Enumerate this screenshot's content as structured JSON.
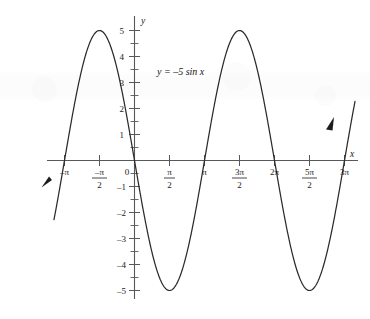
{
  "chart_data": {
    "type": "line",
    "title": "",
    "equation_label": "y = –5 sin x",
    "function": "y = -5*sin(x)",
    "xlabel": "x",
    "ylabel": "y",
    "grid": false,
    "legend": "none",
    "amplitude": 5,
    "period": "2π",
    "xlim": [
      -3.6128,
      9.896
    ],
    "ylim": [
      -5.6,
      5.6
    ],
    "x_tick_labels": [
      {
        "value": -3.14159,
        "label": "–π",
        "type": "plain"
      },
      {
        "value": -1.5708,
        "label": "–π/2",
        "type": "fraction",
        "numerator": "–π",
        "denominator": "2"
      },
      {
        "value": 0,
        "label": "0",
        "type": "plain"
      },
      {
        "value": 1.5708,
        "label": "π/2",
        "type": "fraction",
        "numerator": "π",
        "denominator": "2"
      },
      {
        "value": 3.14159,
        "label": "π",
        "type": "plain"
      },
      {
        "value": 4.71239,
        "label": "3π/2",
        "type": "fraction",
        "numerator": "3π",
        "denominator": "2"
      },
      {
        "value": 6.28319,
        "label": "2π",
        "type": "plain"
      },
      {
        "value": 7.85398,
        "label": "5π/2",
        "type": "fraction",
        "numerator": "5π",
        "denominator": "2"
      },
      {
        "value": 9.42478,
        "label": "3π",
        "type": "plain"
      }
    ],
    "y_tick_labels": [
      {
        "value": 5,
        "label": "5"
      },
      {
        "value": 4,
        "label": "4"
      },
      {
        "value": 3,
        "label": "3"
      },
      {
        "value": 2,
        "label": "2"
      },
      {
        "value": 1,
        "label": "1"
      },
      {
        "value": -1,
        "label": "–1"
      },
      {
        "value": -2,
        "label": "–2"
      },
      {
        "value": -3,
        "label": "–3"
      },
      {
        "value": -4,
        "label": "–4"
      },
      {
        "value": -5,
        "label": "–5"
      }
    ],
    "y_minor_ticks": [
      4.5,
      3.5,
      2.5,
      1.5,
      0.5,
      -0.5,
      -1.5,
      -2.5,
      -3.5,
      -4.5
    ],
    "key_points": [
      {
        "x": -3.14159,
        "y": 0,
        "note": "zero crossing"
      },
      {
        "x": -1.5708,
        "y": 5,
        "note": "maximum"
      },
      {
        "x": 0,
        "y": 0,
        "note": "zero crossing, decreasing"
      },
      {
        "x": 1.5708,
        "y": -5,
        "note": "minimum"
      },
      {
        "x": 3.14159,
        "y": 0,
        "note": "zero crossing"
      },
      {
        "x": 4.71239,
        "y": 5,
        "note": "maximum"
      },
      {
        "x": 6.28319,
        "y": 0,
        "note": "zero crossing"
      },
      {
        "x": 7.85398,
        "y": -5,
        "note": "minimum"
      },
      {
        "x": 9.42478,
        "y": 0,
        "note": "zero crossing"
      }
    ],
    "arrowheads": [
      "curve-left-end-down",
      "curve-right-end-up"
    ],
    "colors": {
      "curve": "#2b2b2b",
      "axis": "#58585a",
      "text": "#1a1a1a",
      "background": "#ffffff"
    }
  }
}
